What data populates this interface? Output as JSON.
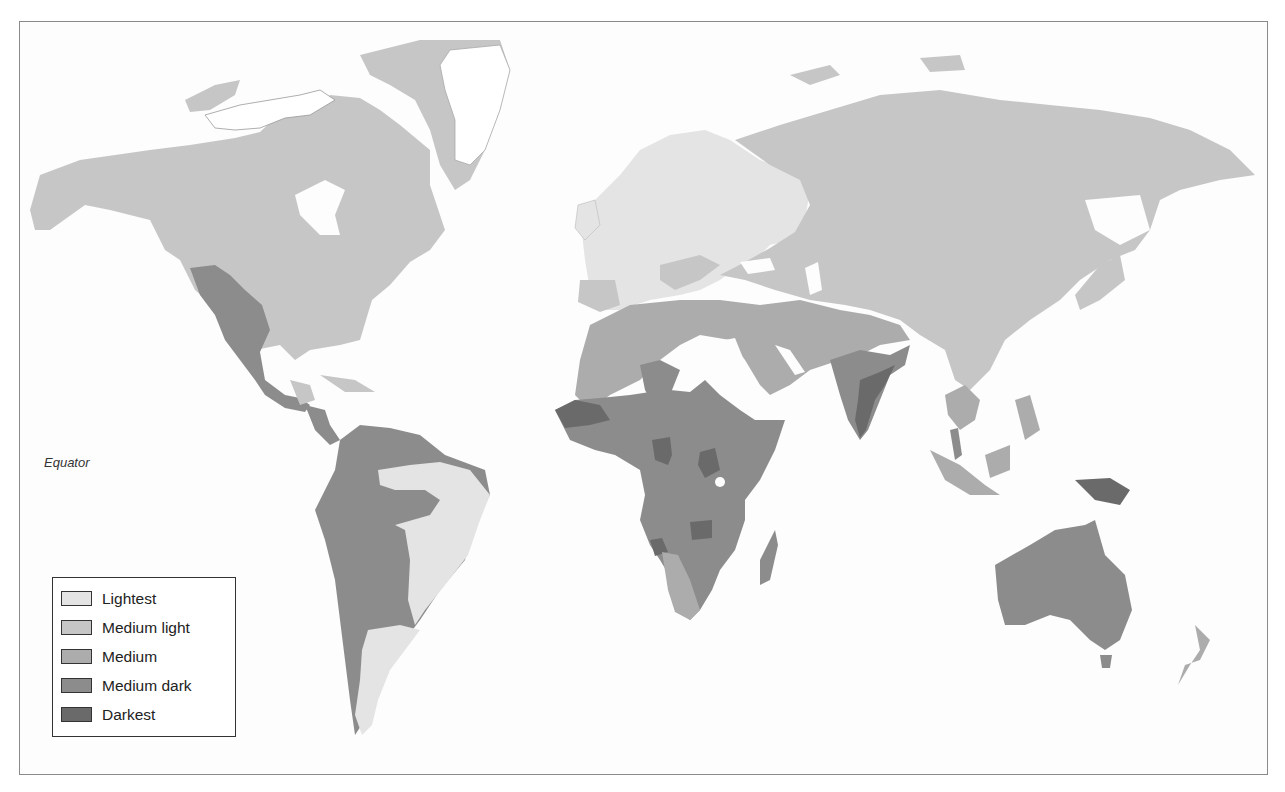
{
  "map": {
    "equator_label": "Equator",
    "ocean_color": "#fdfdfd",
    "border_color": "#8a8a8a"
  },
  "legend": {
    "items": [
      {
        "label": "Lightest",
        "color": "#e4e4e4"
      },
      {
        "label": "Medium light",
        "color": "#c6c6c6"
      },
      {
        "label": "Medium",
        "color": "#acacac"
      },
      {
        "label": "Medium dark",
        "color": "#8c8c8c"
      },
      {
        "label": "Darkest",
        "color": "#6a6a6a"
      }
    ]
  },
  "regions": {
    "ice_white": "#ffffff",
    "north_america_north": "Medium light",
    "north_america_southwest": "Medium dark",
    "greenland_coast": "Medium light",
    "greenland_interior": "white",
    "central_america": "Medium dark",
    "south_america_northwest": "Medium dark",
    "south_america_east": "Lightest",
    "south_america_south": "Lightest",
    "europe": "Lightest",
    "russia_asia": "Medium light",
    "middle_east": "Medium",
    "north_africa": "Medium",
    "sahel": "Medium dark",
    "central_africa": "Medium dark",
    "africa_darkest_spots": "Darkest",
    "southern_africa_west": "Medium",
    "india": "Medium dark",
    "india_east": "Darkest",
    "southeast_asia": "Medium",
    "new_guinea": "Darkest",
    "australia": "Medium dark",
    "new_zealand": "Medium"
  }
}
